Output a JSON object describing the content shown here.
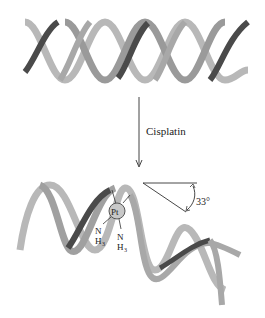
{
  "diagram": {
    "reagent_label": "Cisplatin",
    "angle_label": "33°",
    "platinum_label": "Pt",
    "ligand1_n": "N",
    "ligand1_h": "H",
    "ligand1_sub": "3",
    "ligand2_n": "N",
    "ligand2_h": "H",
    "ligand2_sub": "3",
    "colors": {
      "strand_light": "#b5b5b5",
      "strand_mid": "#8f8f8f",
      "strand_dark": "#4a4a4a",
      "pt_fill": "#c8c8c8",
      "line": "#333333"
    }
  }
}
